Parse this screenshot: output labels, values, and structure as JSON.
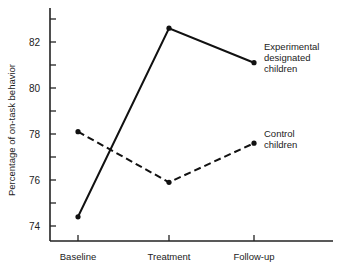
{
  "chart_data": {
    "type": "line",
    "title": "",
    "xlabel": "",
    "ylabel": "Percentage of on-task behavior",
    "categories": [
      "Baseline",
      "Treatment",
      "Follow-up"
    ],
    "ylim": [
      73.4,
      83.5
    ],
    "yticks_labeled": [
      74,
      76,
      78,
      80,
      82
    ],
    "yticks_minor": [
      75,
      77,
      79,
      81,
      83
    ],
    "grid": false,
    "legend_position": "inline-right",
    "series": [
      {
        "name": "Experimental designated children",
        "label_lines": [
          "Experimental",
          "designated",
          "children"
        ],
        "style": "solid",
        "values": [
          74.4,
          82.6,
          81.1
        ]
      },
      {
        "name": "Control children",
        "label_lines": [
          "Control",
          "children"
        ],
        "style": "dashed",
        "values": [
          78.1,
          75.9,
          77.6
        ]
      }
    ]
  }
}
